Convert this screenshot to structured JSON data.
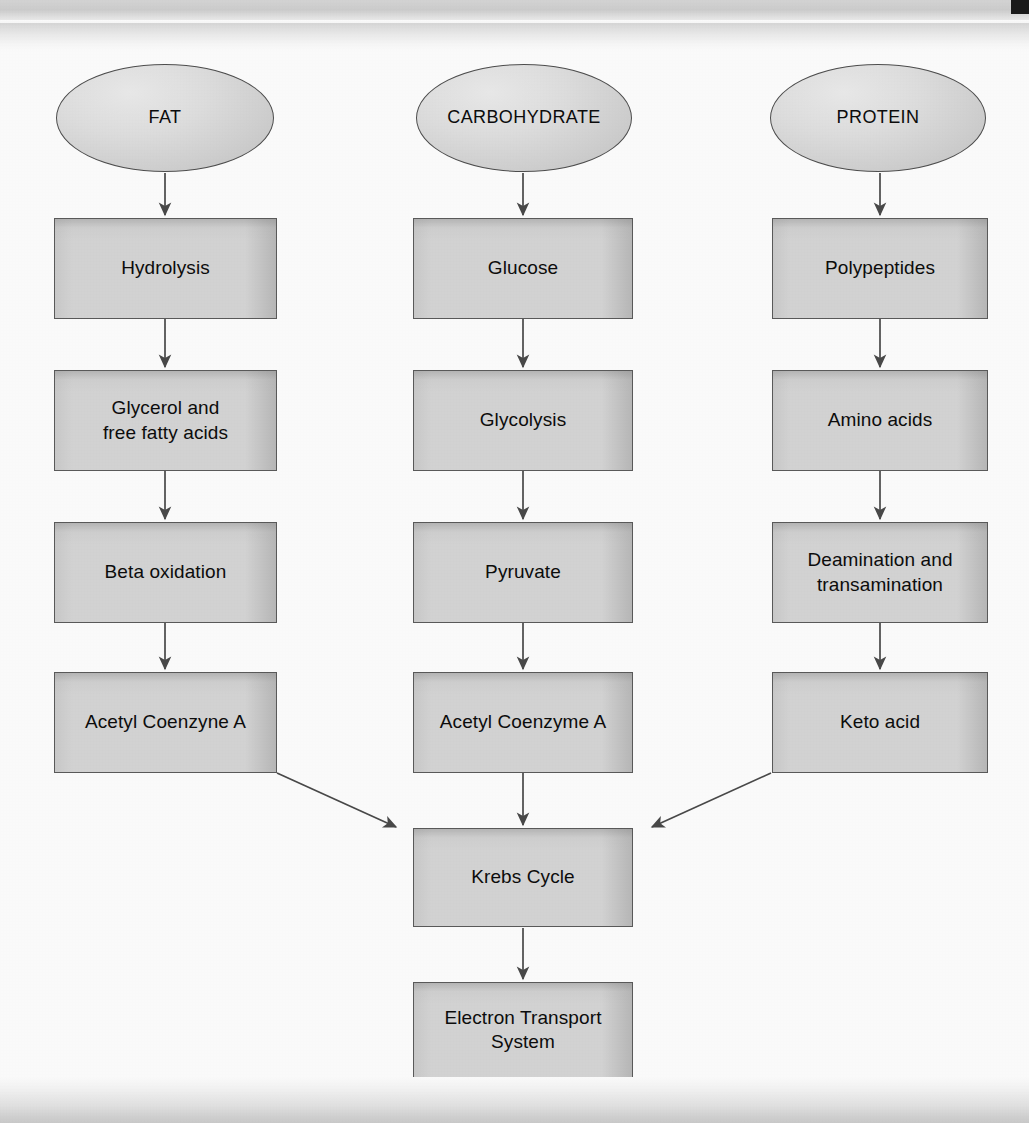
{
  "diagram": {
    "colors": {
      "node_fill": "#d6d6d6",
      "node_border": "#5b5b5b",
      "ellipse_border": "#4f4f4f",
      "connector": "#4a4a4a",
      "text": "#0d0d0d",
      "page_background": "#ffffff",
      "scan_band": "#d7d7d7",
      "corner_mark": "#1b1b1b"
    },
    "columns": [
      {
        "id": "fat",
        "source": {
          "label": "FAT",
          "shape": "ellipse"
        },
        "steps": [
          {
            "label": "Hydrolysis"
          },
          {
            "label": "Glycerol and\nfree fatty acids"
          },
          {
            "label": "Beta oxidation"
          },
          {
            "label": "Acetyl Coenzyne A"
          }
        ]
      },
      {
        "id": "carbohydrate",
        "source": {
          "label": "CARBOHYDRATE",
          "shape": "ellipse"
        },
        "steps": [
          {
            "label": "Glucose"
          },
          {
            "label": "Glycolysis"
          },
          {
            "label": "Pyruvate"
          },
          {
            "label": "Acetyl Coenzyme A"
          }
        ]
      },
      {
        "id": "protein",
        "source": {
          "label": "PROTEIN",
          "shape": "ellipse"
        },
        "steps": [
          {
            "label": "Polypeptides"
          },
          {
            "label": "Amino acids"
          },
          {
            "label": "Deamination and\ntransamination"
          },
          {
            "label": "Keto acid"
          }
        ]
      }
    ],
    "convergence": [
      {
        "id": "krebs",
        "label": "Krebs Cycle"
      },
      {
        "id": "ets",
        "label": "Electron Transport\nSystem"
      }
    ]
  }
}
